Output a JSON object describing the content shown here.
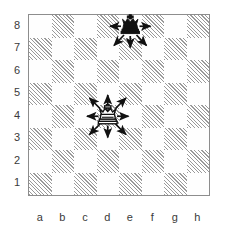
{
  "chart_data": {
    "type": "table",
    "board": {
      "files": [
        "a",
        "b",
        "c",
        "d",
        "e",
        "f",
        "g",
        "h"
      ],
      "ranks": [
        "8",
        "7",
        "6",
        "5",
        "4",
        "3",
        "2",
        "1"
      ],
      "light_square_color": "#fefefe",
      "dark_square_color": "#9a9a9a",
      "dark_square_pattern": "diagonal-hatch",
      "border_color": "#8d8d8d",
      "squares": 64,
      "orientation": "white-bottom"
    },
    "pieces": [
      {
        "name": "black-king",
        "type": "king",
        "color": "black",
        "square": "e8",
        "file": "e",
        "rank": "8"
      },
      {
        "name": "white-king",
        "type": "king",
        "color": "white",
        "square": "d4",
        "file": "d",
        "rank": "4"
      }
    ],
    "arrows": [
      {
        "piece": "black-king",
        "from": "e8",
        "to": "d8",
        "direction": "left"
      },
      {
        "piece": "black-king",
        "from": "e8",
        "to": "f8",
        "direction": "right"
      },
      {
        "piece": "black-king",
        "from": "e8",
        "to": "d7",
        "direction": "down-left"
      },
      {
        "piece": "black-king",
        "from": "e8",
        "to": "e7",
        "direction": "down"
      },
      {
        "piece": "black-king",
        "from": "e8",
        "to": "f7",
        "direction": "down-right"
      },
      {
        "piece": "white-king",
        "from": "d4",
        "to": "c5",
        "direction": "up-left"
      },
      {
        "piece": "white-king",
        "from": "d4",
        "to": "d5",
        "direction": "up"
      },
      {
        "piece": "white-king",
        "from": "d4",
        "to": "e5",
        "direction": "up-right"
      },
      {
        "piece": "white-king",
        "from": "d4",
        "to": "c4",
        "direction": "left"
      },
      {
        "piece": "white-king",
        "from": "d4",
        "to": "e4",
        "direction": "right"
      },
      {
        "piece": "white-king",
        "from": "d4",
        "to": "c3",
        "direction": "down-left"
      },
      {
        "piece": "white-king",
        "from": "d4",
        "to": "d3",
        "direction": "down"
      },
      {
        "piece": "white-king",
        "from": "d4",
        "to": "e3",
        "direction": "down-right"
      }
    ],
    "legend": [],
    "xlabel": "",
    "ylabel": ""
  },
  "labels": {
    "files": [
      "a",
      "b",
      "c",
      "d",
      "e",
      "f",
      "g",
      "h"
    ],
    "ranks": [
      "8",
      "7",
      "6",
      "5",
      "4",
      "3",
      "2",
      "1"
    ]
  },
  "colors": {
    "dark_square": "#9a9a9a",
    "light_square": "#fefefe",
    "border": "#8d8d8d",
    "ink": "#111111",
    "label_text": "#3a3a3a"
  }
}
